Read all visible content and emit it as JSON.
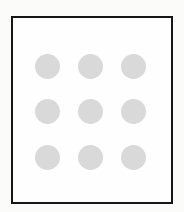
{
  "figure": {
    "canvas": {
      "width": 184,
      "height": 212,
      "background_color": "#fbfbfa"
    },
    "card": {
      "name": "bordered-card",
      "fill_color": "#ffffff",
      "border_color": "#161616",
      "border_width_px": 2,
      "x": 11,
      "y": 16,
      "width": 162,
      "height": 188
    },
    "grid": {
      "name": "dot-grid",
      "rows": 3,
      "columns": 3,
      "dot_count": 9,
      "dot_color": "#d9d9d9",
      "dot_diameter_px": 25,
      "column_centers_x": [
        47,
        90,
        133
      ],
      "row_centers_y": [
        66,
        110,
        157
      ],
      "dots": [
        {
          "id": "dot-r1-c1",
          "row": 1,
          "column": 1,
          "cx": 47,
          "cy": 66
        },
        {
          "id": "dot-r1-c2",
          "row": 1,
          "column": 2,
          "cx": 90,
          "cy": 66
        },
        {
          "id": "dot-r1-c3",
          "row": 1,
          "column": 3,
          "cx": 133,
          "cy": 66
        },
        {
          "id": "dot-r2-c1",
          "row": 2,
          "column": 1,
          "cx": 47,
          "cy": 110
        },
        {
          "id": "dot-r2-c2",
          "row": 2,
          "column": 2,
          "cx": 90,
          "cy": 110
        },
        {
          "id": "dot-r2-c3",
          "row": 2,
          "column": 3,
          "cx": 133,
          "cy": 110
        },
        {
          "id": "dot-r3-c1",
          "row": 3,
          "column": 1,
          "cx": 47,
          "cy": 157
        },
        {
          "id": "dot-r3-c2",
          "row": 3,
          "column": 2,
          "cx": 90,
          "cy": 157
        },
        {
          "id": "dot-r3-c3",
          "row": 3,
          "column": 3,
          "cx": 133,
          "cy": 157
        }
      ]
    }
  }
}
